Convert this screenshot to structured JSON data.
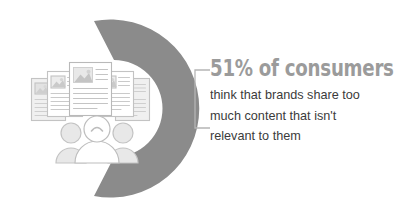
{
  "infographic": {
    "title_stat": "51% of consumers",
    "body_lines": [
      "think that brands share too",
      "much content that isn't",
      "relevant to them"
    ],
    "colors": {
      "arc": "#8b8b8b",
      "headline_text": "#9b9b9b",
      "body_text": "#3b3b3b",
      "illustration_outline": "#bdbdbd",
      "illustration_fill": "#eaeaea",
      "connector": "#b5b5b5",
      "background": "#ffffff"
    },
    "chart": {
      "type": "donut",
      "value_percent": 51,
      "label": "51%",
      "gap_side": "left"
    },
    "illustration": {
      "documents_label": "stacked-content-cards",
      "document_count": 5,
      "people_label": "group-of-three-people",
      "people_count": 3,
      "center_person_expression": "frowning"
    }
  }
}
